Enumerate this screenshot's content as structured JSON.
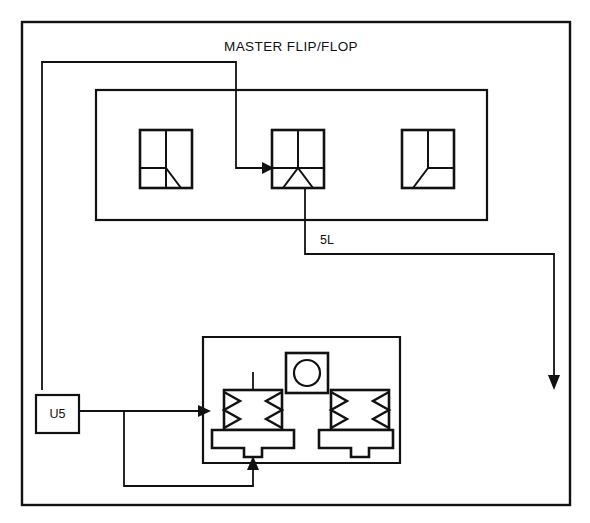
{
  "diagram": {
    "type": "fluidic-logic-schematic",
    "title": "MASTER FLIP/FLOP",
    "stroke_color": "#111111",
    "background_color": "#ffffff"
  },
  "labels": {
    "master_flip_flop": "MASTER FLIP/FLOP",
    "line_5l": "5L",
    "module_u5": "U5"
  },
  "flip_flop_section": {
    "title": "MASTER FLIP/FLOP",
    "elements": [
      {
        "name": "left-logic-element",
        "kind": "fluidic-valve-symbol",
        "variant": "left-diagonal"
      },
      {
        "name": "center-logic-element",
        "kind": "fluidic-valve-symbol",
        "variant": "center-triangle"
      },
      {
        "name": "right-logic-element",
        "kind": "fluidic-valve-symbol",
        "variant": "right-diagonal"
      }
    ]
  },
  "valve_assembly": {
    "indicator": {
      "name": "circular-indicator",
      "shape": "circle-in-square"
    },
    "valves": [
      {
        "name": "left-spring-valve",
        "kind": "spring-return-valve"
      },
      {
        "name": "right-spring-valve",
        "kind": "spring-return-valve"
      }
    ]
  },
  "connections": [
    {
      "name": "u5-to-left-valve",
      "from": "U5",
      "to": "left-spring-valve",
      "arrow": true
    },
    {
      "name": "feedback-to-center-element",
      "from": "valve-assembly",
      "to": "center-logic-element",
      "arrow": true
    },
    {
      "name": "center-element-to-5l",
      "from": "center-logic-element",
      "to": "5L",
      "arrow": false
    },
    {
      "name": "5l-to-output",
      "from": "5L",
      "to": "output-port",
      "arrow": true
    },
    {
      "name": "bottom-feedback-loop",
      "from": "left-branch",
      "to": "valve-assembly-underside",
      "arrow": true
    }
  ]
}
